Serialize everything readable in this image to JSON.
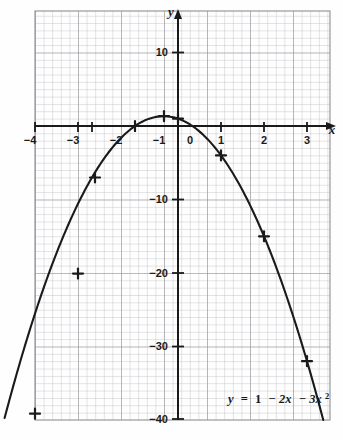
{
  "figure": {
    "name": "graph-of-quadratic-function",
    "background_color": "#fefefe",
    "grid_color_minor": "#b9b9bd",
    "grid_color_major": "#8d8d93",
    "axis_color": "#1a1a1a",
    "curve_color": "#1a1a1a"
  },
  "chart_data": {
    "type": "line",
    "title": "",
    "subtitle": "",
    "xlabel": "x",
    "ylabel": "y",
    "equation_label": "y = 1 − 2x − 3x²",
    "equation_parts": {
      "lhs": "y",
      "equals": "=",
      "constant": "1",
      "linear": "− 2x",
      "quadratic": "− 3x",
      "exponent": "2"
    },
    "function": "y = 1 - 2x - 3x^2",
    "grid": true,
    "grid_minor_step_x": 0.2,
    "grid_minor_step_y": 2,
    "grid_major_step_x": 1,
    "grid_major_step_y": 10,
    "legend_position": "bottom-right",
    "xlim": [
      -4.6,
      3.5
    ],
    "ylim": [
      -40,
      14
    ],
    "xticks": [
      -4,
      -3,
      -2,
      -1,
      0,
      1,
      2,
      3
    ],
    "xticklabels": [
      "−4",
      "−3",
      "−2",
      "−1",
      "0",
      "1",
      "2",
      "3"
    ],
    "yticks": [
      10,
      -10,
      -20,
      -30,
      -40
    ],
    "yticklabels": [
      "10",
      "−10",
      "−20",
      "−30",
      "−40"
    ],
    "vertex": [
      -0.333,
      1.333
    ],
    "x_intercepts": [
      -1,
      0.333
    ],
    "y_intercept": 1,
    "x": [
      -4,
      -3.5,
      -3,
      -2.5,
      -2,
      -1.5,
      -1,
      -0.5,
      0,
      0.5,
      1,
      1.5,
      2,
      2.5,
      3,
      3.3
    ],
    "y": [
      -39,
      -28.75,
      -20,
      -12.75,
      -7,
      -2.75,
      0,
      1.25,
      1,
      -0.75,
      -4,
      -8.75,
      -15,
      -22.75,
      -32,
      -37.47
    ],
    "marked_points": {
      "label": "plotted data points",
      "marker": "cross",
      "x": [
        -4,
        -3,
        -2,
        -1,
        -0.333,
        0,
        1,
        2,
        3
      ],
      "y": [
        -39,
        -20,
        -7,
        0,
        1.333,
        1,
        -4,
        -15,
        -32
      ]
    }
  },
  "axes": {
    "x_axis_name": "x-axis",
    "y_axis_name": "y-axis",
    "x_axis_label": "x",
    "y_axis_label": "y",
    "origin_label": "0"
  }
}
